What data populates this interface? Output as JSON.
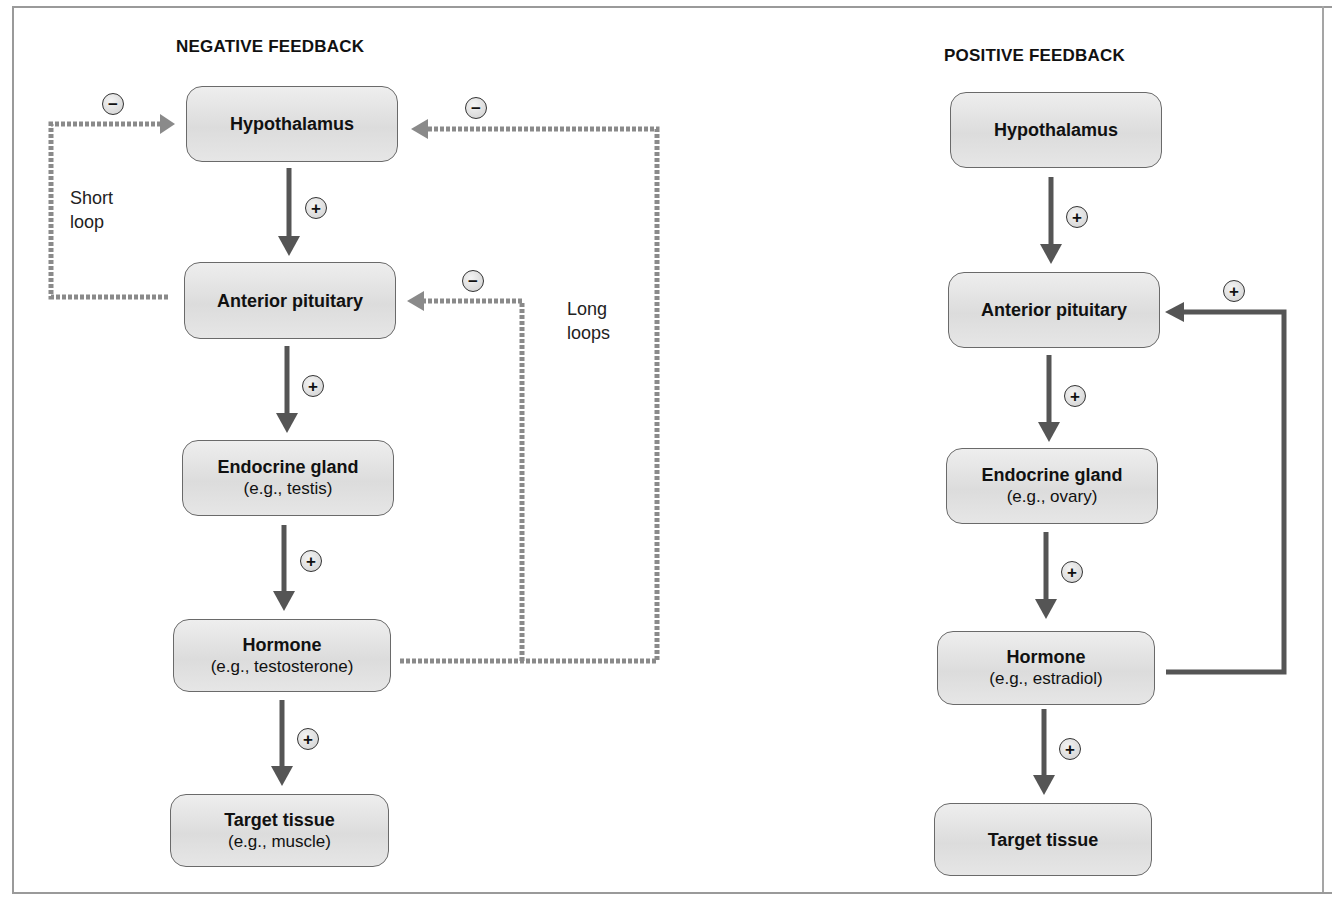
{
  "negative": {
    "title": "NEGATIVE FEEDBACK",
    "boxes": [
      {
        "main": "Hypothalamus",
        "sub": ""
      },
      {
        "main": "Anterior pituitary",
        "sub": ""
      },
      {
        "main": "Endocrine gland",
        "sub": "(e.g., testis)"
      },
      {
        "main": "Hormone",
        "sub": "(e.g., testosterone)"
      },
      {
        "main": "Target tissue",
        "sub": "(e.g., muscle)"
      }
    ],
    "labels": {
      "short_loop_1": "Short",
      "short_loop_2": "loop",
      "long_loops_1": "Long",
      "long_loops_2": "loops"
    },
    "signs": {
      "plus": "+",
      "minus": "−"
    }
  },
  "positive": {
    "title": "POSITIVE FEEDBACK",
    "boxes": [
      {
        "main": "Hypothalamus",
        "sub": ""
      },
      {
        "main": "Anterior pituitary",
        "sub": ""
      },
      {
        "main": "Endocrine gland",
        "sub": "(e.g., ovary)"
      },
      {
        "main": "Hormone",
        "sub": "(e.g., estradiol)"
      },
      {
        "main": "Target tissue",
        "sub": ""
      }
    ],
    "signs": {
      "plus": "+"
    }
  },
  "colors": {
    "arrow": "#555555",
    "dashed": "#8a8a8a",
    "box_fill": "#e2e2e2",
    "box_border": "#6a6a6a"
  }
}
